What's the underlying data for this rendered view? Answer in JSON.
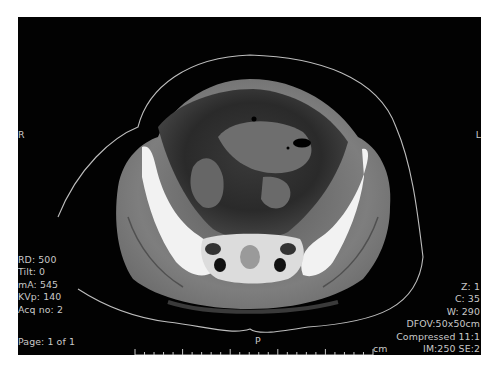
{
  "viewer": {
    "modality": "CT axial pelvis",
    "orientation": {
      "left_marker": "R",
      "right_marker": "L",
      "bottom_marker": "P"
    },
    "acquisition_info": [
      "RD: 500",
      "Tilt: 0",
      "mA: 545",
      "KVp: 140",
      "Acq no: 2"
    ],
    "page_info": "Page: 1 of 1",
    "display_info": [
      "Z: 1",
      "C: 35",
      "W: 290",
      "DFOV:50x50cm",
      "Compressed 11:1",
      "IM:250 SE:2"
    ],
    "scale": {
      "unit": "cm",
      "ticks": 26,
      "major_every": 5
    }
  },
  "colors": {
    "background": "#020202",
    "overlay_text": "#c9c9c9",
    "soft_tissue": "#7d7d7d",
    "bone": "#f2f2f2",
    "page": "#ffffff"
  }
}
